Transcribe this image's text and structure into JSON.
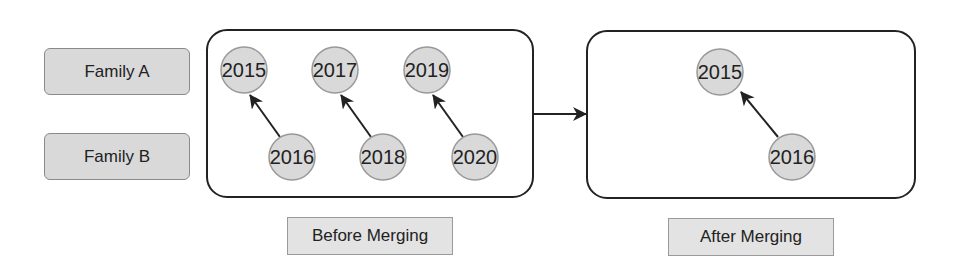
{
  "legend": {
    "family_a": "Family A",
    "family_b": "Family B"
  },
  "panels": {
    "before": {
      "caption": "Before Merging",
      "nodes_family_a": [
        "2015",
        "2017",
        "2019"
      ],
      "nodes_family_b": [
        "2016",
        "2018",
        "2020"
      ],
      "edges": [
        {
          "from": "2016",
          "to": "2015"
        },
        {
          "from": "2018",
          "to": "2017"
        },
        {
          "from": "2020",
          "to": "2019"
        }
      ]
    },
    "after": {
      "caption": "After Merging",
      "nodes_family_a": [
        "2015"
      ],
      "nodes_family_b": [
        "2016"
      ],
      "edges": [
        {
          "from": "2016",
          "to": "2015"
        }
      ]
    }
  },
  "colors": {
    "node_fill": "#d9d9d9",
    "node_stroke": "#999999",
    "line": "#222222",
    "label_fill": "#d9d9d9"
  }
}
